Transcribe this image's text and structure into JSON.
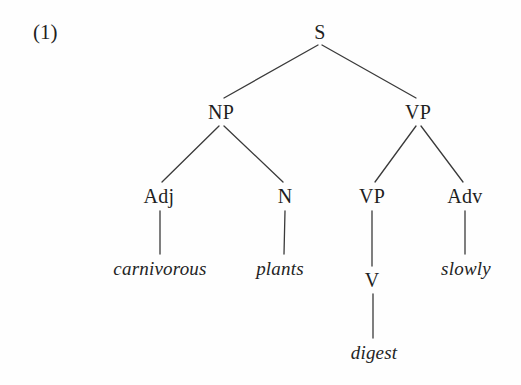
{
  "figure": {
    "example_number": "(1)",
    "background_color": "#fefefe",
    "ink_color": "#1f1f1f",
    "line_color": "#3a3a3a"
  },
  "tree": {
    "nodes": [
      {
        "id": "s",
        "label": "S",
        "kind": "nonterminal",
        "x": 320,
        "y": 32
      },
      {
        "id": "np",
        "label": "NP",
        "kind": "nonterminal",
        "x": 221,
        "y": 112
      },
      {
        "id": "vp",
        "label": "VP",
        "kind": "nonterminal",
        "x": 418,
        "y": 112
      },
      {
        "id": "adj",
        "label": "Adj",
        "kind": "nonterminal",
        "x": 159,
        "y": 196
      },
      {
        "id": "n",
        "label": "N",
        "kind": "nonterminal",
        "x": 285,
        "y": 196
      },
      {
        "id": "vp2",
        "label": "VP",
        "kind": "nonterminal",
        "x": 372,
        "y": 196
      },
      {
        "id": "adv",
        "label": "Adv",
        "kind": "nonterminal",
        "x": 465,
        "y": 196
      },
      {
        "id": "v",
        "label": "V",
        "kind": "nonterminal",
        "x": 372,
        "y": 280
      }
    ],
    "terminals": [
      {
        "id": "w-carnivorous",
        "label": "carnivorous",
        "x": 160,
        "y": 268
      },
      {
        "id": "w-plants",
        "label": "plants",
        "x": 280,
        "y": 268
      },
      {
        "id": "w-slowly",
        "label": "slowly",
        "x": 466,
        "y": 268
      },
      {
        "id": "w-digest",
        "label": "digest",
        "x": 374,
        "y": 352
      }
    ],
    "edges": [
      {
        "from": "s",
        "to": "np",
        "x1": 318,
        "y1": 45,
        "x2": 224,
        "y2": 98
      },
      {
        "from": "s",
        "to": "vp",
        "x1": 322,
        "y1": 45,
        "x2": 416,
        "y2": 98
      },
      {
        "from": "np",
        "to": "adj",
        "x1": 219,
        "y1": 126,
        "x2": 162,
        "y2": 182
      },
      {
        "from": "np",
        "to": "n",
        "x1": 224,
        "y1": 126,
        "x2": 283,
        "y2": 182
      },
      {
        "from": "vp",
        "to": "vp2",
        "x1": 416,
        "y1": 126,
        "x2": 375,
        "y2": 182
      },
      {
        "from": "vp",
        "to": "adv",
        "x1": 421,
        "y1": 126,
        "x2": 463,
        "y2": 182
      },
      {
        "from": "adj",
        "to": "w-carnivorous",
        "x1": 160,
        "y1": 211,
        "x2": 160,
        "y2": 254
      },
      {
        "from": "n",
        "to": "w-plants",
        "x1": 285,
        "y1": 211,
        "x2": 284,
        "y2": 254
      },
      {
        "from": "vp2",
        "to": "v",
        "x1": 372,
        "y1": 211,
        "x2": 372,
        "y2": 266
      },
      {
        "from": "adv",
        "to": "w-slowly",
        "x1": 465,
        "y1": 211,
        "x2": 465,
        "y2": 254
      },
      {
        "from": "v",
        "to": "w-digest",
        "x1": 373,
        "y1": 294,
        "x2": 373,
        "y2": 338
      }
    ]
  },
  "sentence": {
    "text": "carnivorous plants digest slowly",
    "parse": "[S [NP [Adj carnivorous] [N plants]] [VP [VP [V digest]] [Adv slowly]]]"
  }
}
